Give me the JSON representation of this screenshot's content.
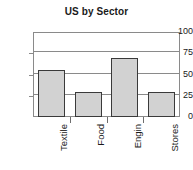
{
  "chart_data": {
    "type": "bar",
    "title": "US by Sector",
    "xlabel": "",
    "ylabel": "",
    "categories": [
      "Textile",
      "Food",
      "Engin",
      "Stores"
    ],
    "values": [
      55,
      30,
      70,
      30
    ],
    "ylim": [
      0,
      100
    ],
    "yticks": [
      0,
      25,
      50,
      75,
      100
    ],
    "ytick_labels": [
      "0",
      "25",
      "50",
      "75",
      "100"
    ],
    "grid": true,
    "legend": false,
    "legend_position": "none",
    "bar_fill_color": "#d2d2d2",
    "bar_edge_color": "#3a3a3a",
    "axis_color": "#8a8a8a",
    "text_color": "#1a1a1a",
    "category_label_rotation": 90
  }
}
